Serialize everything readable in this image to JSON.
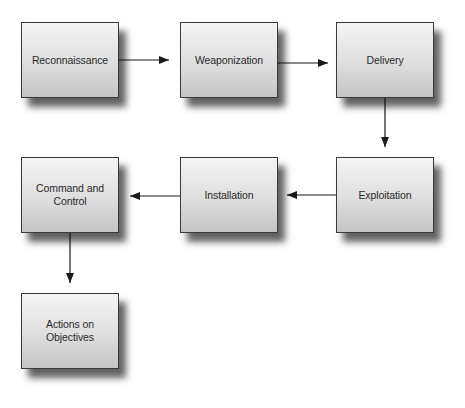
{
  "diagram": {
    "type": "flowchart",
    "stages": [
      {
        "id": "reconnaissance",
        "label": "Reconnaissance",
        "x": 21,
        "y": 22
      },
      {
        "id": "weaponization",
        "label": "Weaponization",
        "x": 180,
        "y": 22
      },
      {
        "id": "delivery",
        "label": "Delivery",
        "x": 336,
        "y": 22
      },
      {
        "id": "exploitation",
        "label": "Exploitation",
        "x": 336,
        "y": 157
      },
      {
        "id": "installation",
        "label": "Installation",
        "x": 180,
        "y": 157
      },
      {
        "id": "command-and-control",
        "label": "Command and Control",
        "x": 21,
        "y": 157
      },
      {
        "id": "actions-on-objectives",
        "label": "Actions on Objectives",
        "x": 21,
        "y": 293
      }
    ],
    "edges": [
      {
        "from": "reconnaissance",
        "to": "weaponization",
        "direction": "right"
      },
      {
        "from": "weaponization",
        "to": "delivery",
        "direction": "right"
      },
      {
        "from": "delivery",
        "to": "exploitation",
        "direction": "down"
      },
      {
        "from": "exploitation",
        "to": "installation",
        "direction": "left"
      },
      {
        "from": "installation",
        "to": "command-and-control",
        "direction": "left"
      },
      {
        "from": "command-and-control",
        "to": "actions-on-objectives",
        "direction": "down"
      }
    ],
    "colors": {
      "box_border": "#3a3a3a",
      "box_fill_top": "#f4f4f4",
      "box_fill_bottom": "#c4c4c4",
      "arrow": "#1a1a1a",
      "text": "#2a2a2a"
    }
  }
}
